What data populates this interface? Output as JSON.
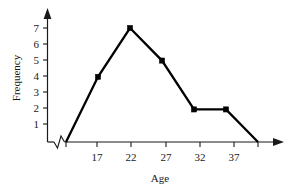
{
  "chart_data": {
    "type": "line",
    "title": "",
    "subtitle": "",
    "xlabel": "Age",
    "ylabel": "Frequency",
    "x": [
      12,
      17,
      22,
      27,
      32,
      37,
      42
    ],
    "values": [
      0,
      4,
      7,
      5,
      2,
      2,
      0
    ],
    "series": [
      {
        "name": "Frequency",
        "values": [
          0,
          4,
          7,
          5,
          2,
          2,
          0
        ]
      }
    ],
    "x_tick_labels": [
      "17",
      "22",
      "27",
      "32",
      "37"
    ],
    "x_tick_values": [
      17,
      22,
      27,
      32,
      37
    ],
    "y_tick_labels": [
      "1",
      "2",
      "3",
      "4",
      "5",
      "6",
      "7"
    ],
    "y_tick_values": [
      1,
      2,
      3,
      4,
      5,
      6,
      7
    ],
    "xlim": [
      10,
      45
    ],
    "ylim": [
      0,
      7.8
    ],
    "grid": false,
    "legend": false,
    "legend_position": "none",
    "axis_break_x": true,
    "marker": "filled-square",
    "line_color": "#000000",
    "axis_color": "#1a1a1a",
    "background_color": "#ffffff",
    "annotations": []
  },
  "labels": {
    "y_axis_title": "Frequency",
    "x_axis_title": "Age",
    "y_7": "7",
    "y_6": "6",
    "y_5": "5",
    "y_4": "4",
    "y_3": "3",
    "y_2": "2",
    "y_1": "1",
    "x_17": "17",
    "x_22": "22",
    "x_27": "27",
    "x_32": "32",
    "x_37": "37"
  }
}
